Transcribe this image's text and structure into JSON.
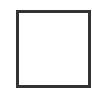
{
  "frame": {
    "label": "",
    "border_color": "#333333",
    "background": "#ffffff"
  }
}
